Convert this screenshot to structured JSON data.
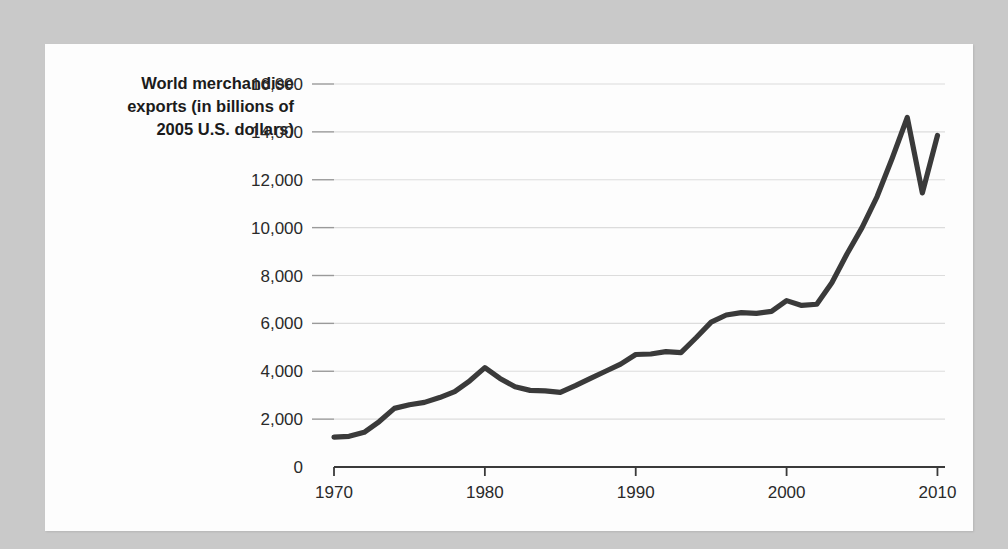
{
  "chart_data": {
    "type": "line",
    "title": "",
    "ylabel": "World merchandise exports (in billions of 2005 U.S. dollars)",
    "ylabel_lines": [
      "World merchandise",
      "exports (in billions of",
      "2005 U.S. dollars)"
    ],
    "xlabel": "",
    "xlim": [
      1970,
      2010.5
    ],
    "ylim": [
      0,
      16000
    ],
    "grid": "horizontal",
    "legend": "none",
    "yticks": [
      0,
      2000,
      4000,
      6000,
      8000,
      10000,
      12000,
      14000,
      16000
    ],
    "ytick_labels": [
      "0",
      "2,000",
      "4,000",
      "6,000",
      "8,000",
      "10,000",
      "12,000",
      "14,000",
      "16,000"
    ],
    "xticks": [
      1970,
      1980,
      1990,
      2000,
      2010
    ],
    "xtick_labels": [
      "1970",
      "1980",
      "1990",
      "2000",
      "2010"
    ],
    "line_color": "#3a3a3a",
    "gridline_color": "#dcdcdc",
    "axis_color": "#3a3a3a",
    "background_color": "#fdfdfd",
    "page_background_color": "#c9c9c9",
    "series": [
      {
        "name": "World merchandise exports",
        "x": [
          1970,
          1971,
          1972,
          1973,
          1974,
          1975,
          1976,
          1977,
          1978,
          1979,
          1980,
          1981,
          1982,
          1983,
          1984,
          1985,
          1986,
          1987,
          1988,
          1989,
          1990,
          1991,
          1992,
          1993,
          1994,
          1995,
          1996,
          1997,
          1998,
          1999,
          2000,
          2001,
          2002,
          2003,
          2004,
          2005,
          2006,
          2007,
          2008,
          2009,
          2010
        ],
        "values": [
          1250,
          1280,
          1450,
          1900,
          2450,
          2600,
          2700,
          2900,
          3150,
          3600,
          4150,
          3700,
          3350,
          3200,
          3180,
          3120,
          3400,
          3700,
          4000,
          4300,
          4700,
          4720,
          4820,
          4780,
          5400,
          6050,
          6350,
          6450,
          6420,
          6500,
          6950,
          6750,
          6800,
          7700,
          8900,
          10000,
          11300,
          12900,
          14600,
          11450,
          13850
        ]
      }
    ]
  }
}
